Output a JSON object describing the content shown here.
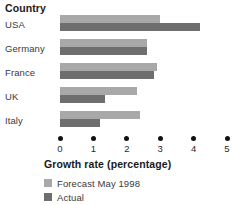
{
  "chart_data": {
    "type": "bar",
    "orientation": "horizontal",
    "title": "Country",
    "xlabel": "Growth rate (percentage)",
    "ylabel": "Country",
    "xlim": [
      0,
      5
    ],
    "xticks": [
      0,
      1,
      2,
      3,
      4,
      5
    ],
    "xtick_labels": [
      "0",
      "1",
      "2",
      "3",
      "4",
      "5"
    ],
    "grid": false,
    "legend_position": "bottom-left",
    "categories": [
      "USA",
      "Germany",
      "France",
      "UK",
      "Italy"
    ],
    "series": [
      {
        "name": "Forecast May 1998",
        "color": "#a8a8a8",
        "values": [
          3.0,
          2.6,
          2.9,
          2.3,
          2.4
        ]
      },
      {
        "name": "Actual",
        "color": "#6e6e6e",
        "values": [
          4.2,
          2.6,
          2.8,
          1.35,
          1.2
        ]
      }
    ]
  },
  "legend": {
    "items": [
      {
        "label": "Forecast May 1998",
        "color": "#a8a8a8"
      },
      {
        "label": "Actual",
        "color": "#6e6e6e"
      }
    ]
  },
  "axis": {
    "ticks": [
      {
        "label": "0"
      },
      {
        "label": "1"
      },
      {
        "label": "2"
      },
      {
        "label": "3"
      },
      {
        "label": "4"
      },
      {
        "label": "5"
      }
    ]
  },
  "rows": [
    {
      "label": "USA",
      "forecast": 3.0,
      "actual": 4.2
    },
    {
      "label": "Germany",
      "forecast": 2.6,
      "actual": 2.6
    },
    {
      "label": "France",
      "forecast": 2.9,
      "actual": 2.8
    },
    {
      "label": "UK",
      "forecast": 2.3,
      "actual": 1.35
    },
    {
      "label": "Italy",
      "forecast": 2.4,
      "actual": 1.2
    }
  ]
}
